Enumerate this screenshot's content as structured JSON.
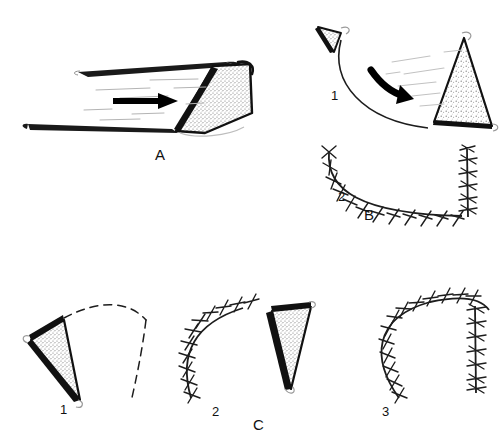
{
  "figure": {
    "background_color": "#ffffff",
    "ink_color": "#111111",
    "stipple_color": "#8c8c8c",
    "width": 500,
    "height": 446
  },
  "panels": [
    {
      "id": "A",
      "label": "A",
      "label_x": 155,
      "label_y": 146,
      "description": "Advancement flap: parallel incision lines with a stippled triangular flap advanced along a straight solid arrow",
      "steps": []
    },
    {
      "id": "B",
      "label": "B",
      "label_x": 364,
      "label_y": 206,
      "description": "Rotation flap: step 1 flap rotated along a curved arc with a curved arrow, step 2 the sutured closure",
      "steps": [
        {
          "label": "1",
          "x": 331,
          "y": 88,
          "description": "flap rotation along arc with curved arrow"
        },
        {
          "label": "2",
          "x": 338,
          "y": 189,
          "description": "sutured arc and vertical limb closure"
        }
      ]
    },
    {
      "id": "C",
      "label": "C",
      "label_x": 253,
      "label_y": 416,
      "description": "Three-stage flap transposition: marked flap with dashed defect, partial suture line with flap, completed suture closure",
      "steps": [
        {
          "label": "1",
          "x": 60,
          "y": 402,
          "description": "stippled triangular flap with dashed arc outline of defect"
        },
        {
          "label": "2",
          "x": 212,
          "y": 404,
          "description": "sutured arc with transposed stippled flap beside it"
        },
        {
          "label": "3",
          "x": 382,
          "y": 404,
          "description": "completed suture closure arc"
        }
      ]
    }
  ],
  "annotations": {
    "arrow_a": "straight-arrow-right",
    "arrow_b": "curved-arrow-rotation",
    "dashed_outline_c1": "dashed-defect-outline",
    "suture_marks": "interrupted-suture-stitches"
  }
}
